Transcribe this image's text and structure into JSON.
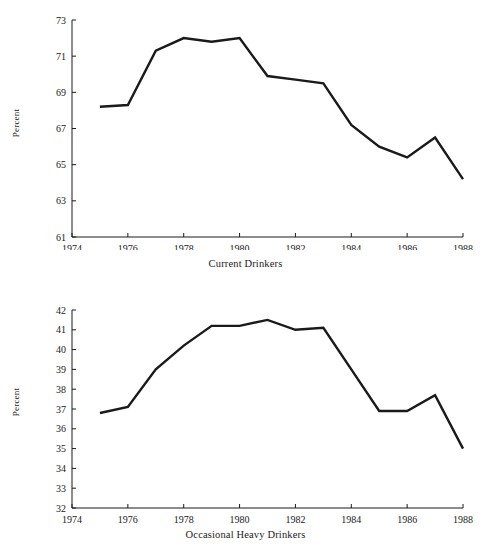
{
  "figure": {
    "background_color": "#ffffff",
    "ink_color": "#1a1a1a"
  },
  "charts": [
    {
      "id": "current-drinkers",
      "caption": "Current Drinkers",
      "ylabel": "Percent",
      "y_ticks": [
        "61",
        "63",
        "65",
        "67",
        "69",
        "71",
        "73"
      ],
      "x_ticks": [
        "1974",
        "1976",
        "1978",
        "1980",
        "1982",
        "1984",
        "1986",
        "1988"
      ]
    },
    {
      "id": "occasional-heavy-drinkers",
      "caption": "Occasional Heavy Drinkers",
      "ylabel": "Percent",
      "y_ticks": [
        "32",
        "33",
        "34",
        "35",
        "36",
        "37",
        "38",
        "39",
        "40",
        "41",
        "42"
      ],
      "x_ticks": [
        "1974",
        "1976",
        "1978",
        "1980",
        "1982",
        "1984",
        "1986",
        "1988"
      ]
    }
  ],
  "chart_data": [
    {
      "type": "line",
      "title": "Current Drinkers",
      "xlabel": "",
      "ylabel": "Percent",
      "x": [
        1975,
        1976,
        1977,
        1978,
        1979,
        1980,
        1981,
        1982,
        1983,
        1984,
        1985,
        1986,
        1987,
        1988
      ],
      "values": [
        68.2,
        68.3,
        71.3,
        72.0,
        71.8,
        72.0,
        69.9,
        69.7,
        69.5,
        67.2,
        66.0,
        65.4,
        66.5,
        64.2
      ],
      "xlim": [
        1974,
        1988
      ],
      "ylim": [
        61,
        73
      ],
      "y_tick_values": [
        61,
        63,
        65,
        67,
        69,
        71,
        73
      ],
      "x_tick_values": [
        1974,
        1976,
        1978,
        1980,
        1982,
        1984,
        1986,
        1988
      ],
      "grid": false,
      "legend": "none",
      "line_color": "#1a1a1a",
      "line_width": 2.4
    },
    {
      "type": "line",
      "title": "Occasional Heavy Drinkers",
      "xlabel": "",
      "ylabel": "Percent",
      "x": [
        1975,
        1976,
        1977,
        1978,
        1979,
        1980,
        1981,
        1982,
        1983,
        1984,
        1985,
        1986,
        1987,
        1988
      ],
      "values": [
        36.8,
        37.1,
        39.0,
        40.2,
        41.2,
        41.2,
        41.5,
        41.0,
        41.1,
        39.0,
        36.9,
        36.9,
        37.7,
        35.0
      ],
      "xlim": [
        1974,
        1988
      ],
      "ylim": [
        32,
        42
      ],
      "y_tick_values": [
        32,
        33,
        34,
        35,
        36,
        37,
        38,
        39,
        40,
        41,
        42
      ],
      "x_tick_values": [
        1974,
        1976,
        1978,
        1980,
        1982,
        1984,
        1986,
        1988
      ],
      "grid": false,
      "legend": "none",
      "line_color": "#1a1a1a",
      "line_width": 2.4
    }
  ]
}
